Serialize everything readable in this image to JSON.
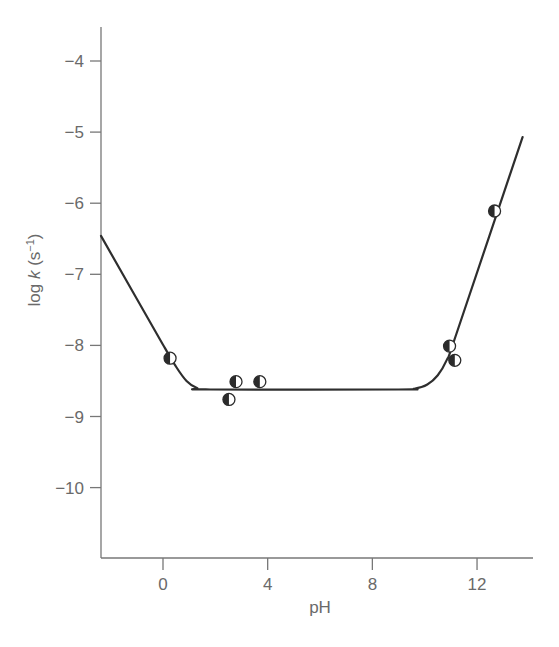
{
  "chart_data": {
    "type": "scatter",
    "title": "",
    "xlabel": "pH",
    "ylabel_parts": {
      "base": "log ",
      "italic": "k",
      "unit_open": " (s",
      "sup": "−1",
      "unit_close": ")"
    },
    "ylabel": "log k (s⁻¹)",
    "xlim": [
      -2.37,
      14.1
    ],
    "ylim": [
      -11.0,
      -3.5
    ],
    "xticks": [
      0,
      4,
      8,
      12
    ],
    "xtick_labels": [
      "0",
      "4",
      "8",
      "12"
    ],
    "yticks": [
      -4,
      -5,
      -6,
      -7,
      -8,
      -9,
      -10
    ],
    "ytick_labels": [
      "−4",
      "−5",
      "−6",
      "−7",
      "−8",
      "−9",
      "−10"
    ],
    "grid": false,
    "legend": null,
    "series": [
      {
        "name": "measured",
        "marker": "half-filled-circle",
        "points": [
          {
            "x": 0.27,
            "y": -8.18
          },
          {
            "x": 2.52,
            "y": -8.76
          },
          {
            "x": 2.79,
            "y": -8.51
          },
          {
            "x": 3.7,
            "y": -8.51
          },
          {
            "x": 10.95,
            "y": -8.01
          },
          {
            "x": 11.15,
            "y": -8.21
          },
          {
            "x": 12.67,
            "y": -6.11
          }
        ]
      },
      {
        "name": "fit",
        "type": "line",
        "points": [
          {
            "x": -2.37,
            "y": -6.46
          },
          {
            "x": 0.0,
            "y": -7.99
          },
          {
            "x": 0.5,
            "y": -8.3
          },
          {
            "x": 0.9,
            "y": -8.5
          },
          {
            "x": 1.3,
            "y": -8.6
          },
          {
            "x": 1.8,
            "y": -8.62
          },
          {
            "x": 9.0,
            "y": -8.62
          },
          {
            "x": 9.6,
            "y": -8.61
          },
          {
            "x": 10.1,
            "y": -8.55
          },
          {
            "x": 10.5,
            "y": -8.42
          },
          {
            "x": 10.85,
            "y": -8.2
          },
          {
            "x": 11.2,
            "y": -7.85
          },
          {
            "x": 13.74,
            "y": -5.07
          }
        ]
      }
    ]
  },
  "colors": {
    "axis": "#777777",
    "text": "#6a6a6a",
    "curve": "#2e2e2e",
    "marker_fill": "#2b2b2b",
    "marker_open": "#ffffff"
  }
}
